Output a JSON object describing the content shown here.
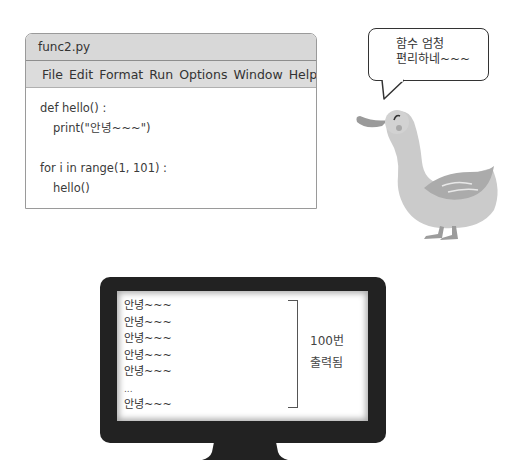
{
  "editor": {
    "title": "func2.py",
    "menu": [
      "File",
      "Edit",
      "Format",
      "Run",
      "Options",
      "Window",
      "Help"
    ],
    "code": [
      {
        "text": "def hello() :",
        "indent": false
      },
      {
        "text": "print(\"안녕~~~\")",
        "indent": true
      },
      {
        "text": "",
        "indent": false
      },
      {
        "text": "for i in range(1, 101) :",
        "indent": false
      },
      {
        "text": "hello()",
        "indent": true
      }
    ]
  },
  "bubble": {
    "line1": "함수 엄청",
    "line2": "편리하네~~~"
  },
  "character": {
    "icon": "duck-icon"
  },
  "monitor": {
    "output": [
      "안녕~~~",
      "안녕~~~",
      "안녕~~~",
      "안녕~~~",
      "안녕~~~",
      "...",
      "안녕~~~"
    ],
    "annotation_line1": "100번",
    "annotation_line2": "출력됨"
  },
  "colors": {
    "title_bar": "#d8d8d8",
    "monitor_frame": "#222222",
    "duck_body": "#c9c9c9"
  }
}
